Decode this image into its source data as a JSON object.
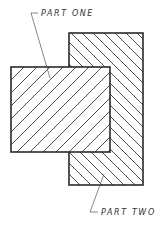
{
  "diagram": {
    "parts": [
      {
        "id": "part-one",
        "label": "PART ONE",
        "hatch_direction": "forward-slash"
      },
      {
        "id": "part-two",
        "label": "PART TWO",
        "hatch_direction": "back-slash"
      }
    ],
    "colors": {
      "line": "#2a2a2a",
      "text": "#333333",
      "background": "#ffffff"
    }
  }
}
